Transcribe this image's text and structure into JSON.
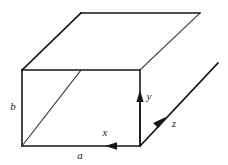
{
  "figure": {
    "background_color": "#ffffff",
    "line_color": "#161616",
    "thin_line_color": "#3a3a3a",
    "label_color": "#1a1a1a"
  },
  "labels": {
    "width_label": "a",
    "height_label": "b",
    "x_axis_label": "x",
    "y_axis_label": "y",
    "z_axis_label": "z"
  },
  "geometry": {
    "front_face": {
      "top_left": [
        22,
        70
      ],
      "top_right": [
        140,
        70
      ],
      "bottom_right": [
        140,
        146
      ],
      "bottom_left": [
        22,
        146
      ]
    },
    "depth_offset": [
      59,
      -57
    ],
    "interior_diagonal": {
      "from": [
        22,
        146
      ],
      "to": [
        81,
        70
      ]
    },
    "receding_edges": [
      {
        "from": [
          22,
          70
        ],
        "to": [
          81,
          13
        ]
      },
      {
        "from": [
          140,
          70
        ],
        "to": [
          200,
          13
        ]
      },
      {
        "from": [
          140,
          146
        ],
        "to": [
          218,
          63
        ]
      }
    ],
    "top_back_edge": {
      "from": [
        81,
        13
      ],
      "to": [
        200,
        13
      ]
    }
  },
  "axes": {
    "x": {
      "direction": "left",
      "from": [
        140,
        146
      ],
      "to": [
        66,
        146
      ],
      "arrow_at": [
        113,
        146
      ],
      "label_at": [
        105,
        133
      ]
    },
    "y": {
      "direction": "up",
      "from": [
        140,
        146
      ],
      "to": [
        140,
        93
      ],
      "arrow_at": [
        140,
        95
      ],
      "label_at": [
        149,
        97
      ]
    },
    "z": {
      "direction": "up-right",
      "from": [
        140,
        146
      ],
      "to": [
        218,
        63
      ],
      "arrow_at": [
        162,
        121
      ],
      "label_at": [
        173,
        124
      ]
    }
  },
  "label_positions": {
    "a": [
      80,
      156
    ],
    "b": [
      13,
      107
    ]
  }
}
